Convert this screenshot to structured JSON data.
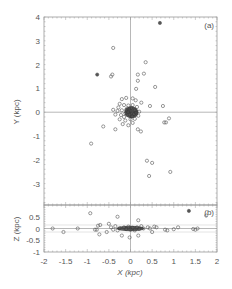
{
  "chart_data": [
    {
      "panel": "a",
      "type": "scatter",
      "title": "",
      "panel_label": "(a)",
      "xlabel": "X (kpc)",
      "ylabel": "Y (kpc)",
      "xlim": [
        -2,
        2
      ],
      "ylim": [
        -3.9,
        4
      ],
      "yticks": [
        "4",
        "3",
        "2",
        "1",
        "0",
        "-1",
        "-2",
        "-3"
      ],
      "ytick_values": [
        4,
        3,
        2,
        1,
        0,
        -1,
        -2,
        -3
      ],
      "reference_lines": {
        "x": 0,
        "y": 0
      },
      "grid": false,
      "points": [
        {
          "x": 0.68,
          "y": 3.75,
          "filled": true
        },
        {
          "x": -0.4,
          "y": 2.7
        },
        {
          "x": 0.35,
          "y": 2.1
        },
        {
          "x": -0.77,
          "y": 1.58,
          "filled": true
        },
        {
          "x": -0.45,
          "y": 1.5
        },
        {
          "x": -0.42,
          "y": 1.58
        },
        {
          "x": 0.17,
          "y": 1.58
        },
        {
          "x": 0.31,
          "y": 1.62
        },
        {
          "x": 0.17,
          "y": 1.32
        },
        {
          "x": 0.57,
          "y": 1.06
        },
        {
          "x": 0.13,
          "y": 0.98
        },
        {
          "x": 0.45,
          "y": 0.26
        },
        {
          "x": 0.75,
          "y": 0.26
        },
        {
          "x": 0.78,
          "y": -0.43
        },
        {
          "x": 0.82,
          "y": -0.43
        },
        {
          "x": 0.89,
          "y": -0.26
        },
        {
          "x": -0.63,
          "y": -0.6
        },
        {
          "x": -0.35,
          "y": -0.72
        },
        {
          "x": 0.17,
          "y": -0.72
        },
        {
          "x": 0.24,
          "y": -0.81
        },
        {
          "x": -0.91,
          "y": -1.32
        },
        {
          "x": 0.38,
          "y": -2.04
        },
        {
          "x": 0.5,
          "y": -2.13
        },
        {
          "x": 0.43,
          "y": -2.68
        },
        {
          "x": 0.92,
          "y": -2.51
        },
        {
          "x": -0.2,
          "y": 0.55
        },
        {
          "x": -0.1,
          "y": 0.6
        },
        {
          "x": 0.05,
          "y": 0.58
        },
        {
          "x": 0.12,
          "y": 0.5
        },
        {
          "x": -0.25,
          "y": 0.35
        },
        {
          "x": -0.15,
          "y": 0.3
        },
        {
          "x": -0.05,
          "y": 0.28
        },
        {
          "x": 0.05,
          "y": 0.3
        },
        {
          "x": 0.15,
          "y": 0.22
        },
        {
          "x": -0.3,
          "y": 0.05
        },
        {
          "x": -0.2,
          "y": 0.08
        },
        {
          "x": -0.1,
          "y": 0.1
        },
        {
          "x": 0.0,
          "y": 0.05
        },
        {
          "x": 0.1,
          "y": 0.08
        },
        {
          "x": 0.2,
          "y": 0.02
        },
        {
          "x": -0.35,
          "y": -0.1
        },
        {
          "x": -0.22,
          "y": -0.12
        },
        {
          "x": -0.12,
          "y": -0.05
        },
        {
          "x": -0.02,
          "y": -0.1
        },
        {
          "x": 0.08,
          "y": -0.08
        },
        {
          "x": 0.18,
          "y": -0.15
        },
        {
          "x": -0.25,
          "y": -0.3
        },
        {
          "x": -0.12,
          "y": -0.35
        },
        {
          "x": 0.0,
          "y": -0.3
        },
        {
          "x": 0.1,
          "y": -0.28
        },
        {
          "x": -0.18,
          "y": -0.5
        },
        {
          "x": -0.05,
          "y": -0.55
        },
        {
          "x": 0.05,
          "y": -0.45
        },
        {
          "x": -0.08,
          "y": 0.15
        },
        {
          "x": 0.02,
          "y": 0.18
        },
        {
          "x": -0.15,
          "y": -0.2
        },
        {
          "x": 0.12,
          "y": -0.02
        },
        {
          "x": -0.05,
          "y": 0.0
        },
        {
          "x": 0.04,
          "y": -0.18
        },
        {
          "x": -0.28,
          "y": 0.2
        },
        {
          "x": 0.25,
          "y": 0.4
        },
        {
          "x": -0.4,
          "y": 0.1
        }
      ]
    },
    {
      "panel": "b",
      "type": "scatter",
      "panel_label": "(b)",
      "xlabel": "X (kpc)",
      "ylabel": "Z (kpc)",
      "xlim": [
        -2,
        2
      ],
      "ylim": [
        -1,
        1
      ],
      "xticks": [
        "-2",
        "-1.5",
        "-1",
        "-0.5",
        "0",
        "0.5",
        "1",
        "1.5",
        "2"
      ],
      "xtick_values": [
        -2,
        -1.5,
        -1,
        -0.5,
        0,
        0.5,
        1,
        1.5,
        2
      ],
      "yticks": [
        "0.5",
        "0",
        "-0.5",
        "-1"
      ],
      "ytick_values": [
        0.5,
        0,
        -0.5,
        -1
      ],
      "reference_lines": {
        "x": 0,
        "y": 0,
        "y_band": [
          -0.15,
          0.15
        ]
      },
      "grid": false,
      "points": [
        {
          "x": -1.8,
          "y": 0.0
        },
        {
          "x": -1.55,
          "y": -0.15
        },
        {
          "x": -1.22,
          "y": 0.0
        },
        {
          "x": -0.93,
          "y": 0.65
        },
        {
          "x": -0.82,
          "y": -0.05
        },
        {
          "x": -0.78,
          "y": -0.05
        },
        {
          "x": -0.75,
          "y": 0.12
        },
        {
          "x": -0.72,
          "y": -0.25
        },
        {
          "x": -0.7,
          "y": 0.15
        },
        {
          "x": -0.55,
          "y": -0.15
        },
        {
          "x": -0.5,
          "y": 0.2
        },
        {
          "x": -0.45,
          "y": 0.05
        },
        {
          "x": -0.4,
          "y": -0.05
        },
        {
          "x": -0.35,
          "y": 0.1
        },
        {
          "x": -0.3,
          "y": -0.08
        },
        {
          "x": -0.25,
          "y": 0.02
        },
        {
          "x": -0.2,
          "y": -0.3
        },
        {
          "x": -0.15,
          "y": 0.05
        },
        {
          "x": -0.1,
          "y": -0.02
        },
        {
          "x": -0.05,
          "y": 0.08
        },
        {
          "x": 0.0,
          "y": -0.05
        },
        {
          "x": 0.05,
          "y": 0.03
        },
        {
          "x": 0.1,
          "y": -0.08
        },
        {
          "x": 0.15,
          "y": 0.05
        },
        {
          "x": 0.2,
          "y": -0.02
        },
        {
          "x": 0.25,
          "y": 0.1
        },
        {
          "x": 0.3,
          "y": 0.0
        },
        {
          "x": -0.02,
          "y": -0.38
        },
        {
          "x": 0.18,
          "y": 0.35
        },
        {
          "x": 0.18,
          "y": -0.3
        },
        {
          "x": -0.3,
          "y": 0.5
        },
        {
          "x": 0.4,
          "y": 0.05
        },
        {
          "x": 0.45,
          "y": 0.0
        },
        {
          "x": 0.5,
          "y": -0.15
        },
        {
          "x": 0.55,
          "y": 0.08
        },
        {
          "x": 0.6,
          "y": 0.05
        },
        {
          "x": 0.8,
          "y": -0.05
        },
        {
          "x": 0.85,
          "y": -0.08
        },
        {
          "x": 1.0,
          "y": -0.03
        },
        {
          "x": 1.1,
          "y": 0.05
        },
        {
          "x": 1.45,
          "y": -0.02
        },
        {
          "x": 1.5,
          "y": -0.05
        },
        {
          "x": 1.55,
          "y": 0.0
        },
        {
          "x": 1.35,
          "y": 0.75,
          "filled": true
        },
        {
          "x": 1.75,
          "y": 0.55
        }
      ]
    }
  ]
}
